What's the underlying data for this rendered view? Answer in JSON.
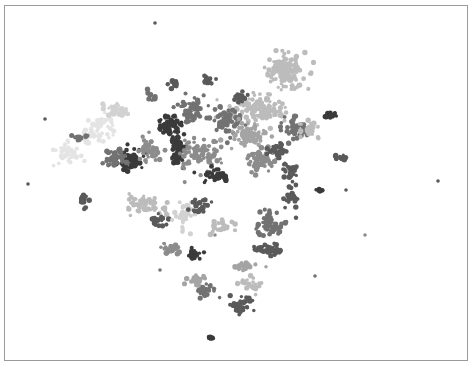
{
  "chart_data": {
    "type": "scatter",
    "title": "",
    "xlabel": "",
    "ylabel": "",
    "axes_visible": false,
    "grid": false,
    "legend": "none",
    "frame": {
      "x": 4,
      "y": 5,
      "width": 464,
      "height": 356,
      "border_color": "#9a9a9a"
    },
    "palette": [
      "#3a3a3a",
      "#5a5a5a",
      "#727272",
      "#8c8c8c",
      "#a4a4a4",
      "#bcbcbc",
      "#d2d2d2",
      "#e4e4e4"
    ],
    "clusters": [
      {
        "cx": 285,
        "cy": 72,
        "rx": 18,
        "ry": 16,
        "shade": 5,
        "n": 140
      },
      {
        "cx": 258,
        "cy": 110,
        "rx": 22,
        "ry": 12,
        "shade": 5,
        "n": 120
      },
      {
        "cx": 240,
        "cy": 96,
        "rx": 8,
        "ry": 6,
        "shade": 1,
        "n": 25
      },
      {
        "cx": 207,
        "cy": 80,
        "rx": 5,
        "ry": 5,
        "shade": 1,
        "n": 14
      },
      {
        "cx": 172,
        "cy": 84,
        "rx": 5,
        "ry": 4,
        "shade": 1,
        "n": 12
      },
      {
        "cx": 151,
        "cy": 97,
        "rx": 6,
        "ry": 5,
        "shade": 2,
        "n": 14
      },
      {
        "cx": 190,
        "cy": 110,
        "rx": 14,
        "ry": 10,
        "shade": 2,
        "n": 60
      },
      {
        "cx": 225,
        "cy": 122,
        "rx": 16,
        "ry": 12,
        "shade": 2,
        "n": 70
      },
      {
        "cx": 167,
        "cy": 125,
        "rx": 12,
        "ry": 8,
        "shade": 0,
        "n": 50
      },
      {
        "cx": 177,
        "cy": 150,
        "rx": 6,
        "ry": 18,
        "shade": 0,
        "n": 70
      },
      {
        "cx": 130,
        "cy": 160,
        "rx": 14,
        "ry": 10,
        "shade": 0,
        "n": 60
      },
      {
        "cx": 115,
        "cy": 158,
        "rx": 10,
        "ry": 8,
        "shade": 2,
        "n": 40
      },
      {
        "cx": 150,
        "cy": 150,
        "rx": 12,
        "ry": 10,
        "shade": 3,
        "n": 45
      },
      {
        "cx": 200,
        "cy": 155,
        "rx": 18,
        "ry": 14,
        "shade": 3,
        "n": 80
      },
      {
        "cx": 215,
        "cy": 175,
        "rx": 12,
        "ry": 6,
        "shade": 0,
        "n": 35
      },
      {
        "cx": 250,
        "cy": 135,
        "rx": 16,
        "ry": 10,
        "shade": 4,
        "n": 70
      },
      {
        "cx": 260,
        "cy": 160,
        "rx": 14,
        "ry": 10,
        "shade": 3,
        "n": 60
      },
      {
        "cx": 280,
        "cy": 150,
        "rx": 10,
        "ry": 8,
        "shade": 1,
        "n": 35
      },
      {
        "cx": 295,
        "cy": 130,
        "rx": 10,
        "ry": 10,
        "shade": 2,
        "n": 40
      },
      {
        "cx": 310,
        "cy": 130,
        "rx": 8,
        "ry": 8,
        "shade": 5,
        "n": 30
      },
      {
        "cx": 290,
        "cy": 170,
        "rx": 8,
        "ry": 8,
        "shade": 1,
        "n": 25
      },
      {
        "cx": 330,
        "cy": 115,
        "rx": 6,
        "ry": 3,
        "shade": 0,
        "n": 14
      },
      {
        "cx": 340,
        "cy": 158,
        "rx": 7,
        "ry": 3,
        "shade": 1,
        "n": 14
      },
      {
        "cx": 100,
        "cy": 130,
        "rx": 16,
        "ry": 12,
        "shade": 7,
        "n": 50
      },
      {
        "cx": 65,
        "cy": 150,
        "rx": 14,
        "ry": 10,
        "shade": 7,
        "n": 35
      },
      {
        "cx": 80,
        "cy": 138,
        "rx": 5,
        "ry": 4,
        "shade": 2,
        "n": 10
      },
      {
        "cx": 115,
        "cy": 110,
        "rx": 10,
        "ry": 8,
        "shade": 6,
        "n": 30
      },
      {
        "cx": 84,
        "cy": 200,
        "rx": 3,
        "ry": 8,
        "shade": 1,
        "n": 18
      },
      {
        "cx": 145,
        "cy": 205,
        "rx": 18,
        "ry": 10,
        "shade": 5,
        "n": 60
      },
      {
        "cx": 160,
        "cy": 220,
        "rx": 8,
        "ry": 6,
        "shade": 1,
        "n": 22
      },
      {
        "cx": 185,
        "cy": 215,
        "rx": 10,
        "ry": 12,
        "shade": 6,
        "n": 40
      },
      {
        "cx": 200,
        "cy": 205,
        "rx": 8,
        "ry": 8,
        "shade": 1,
        "n": 25
      },
      {
        "cx": 222,
        "cy": 225,
        "rx": 10,
        "ry": 8,
        "shade": 5,
        "n": 30
      },
      {
        "cx": 170,
        "cy": 248,
        "rx": 10,
        "ry": 6,
        "shade": 3,
        "n": 28
      },
      {
        "cx": 195,
        "cy": 255,
        "rx": 6,
        "ry": 6,
        "shade": 0,
        "n": 20
      },
      {
        "cx": 206,
        "cy": 290,
        "rx": 10,
        "ry": 8,
        "shade": 2,
        "n": 35
      },
      {
        "cx": 195,
        "cy": 280,
        "rx": 10,
        "ry": 6,
        "shade": 4,
        "n": 25
      },
      {
        "cx": 270,
        "cy": 225,
        "rx": 12,
        "ry": 10,
        "shade": 2,
        "n": 55
      },
      {
        "cx": 268,
        "cy": 250,
        "rx": 12,
        "ry": 6,
        "shade": 1,
        "n": 35
      },
      {
        "cx": 245,
        "cy": 265,
        "rx": 10,
        "ry": 4,
        "shade": 4,
        "n": 25
      },
      {
        "cx": 250,
        "cy": 285,
        "rx": 10,
        "ry": 6,
        "shade": 5,
        "n": 25
      },
      {
        "cx": 240,
        "cy": 305,
        "rx": 10,
        "ry": 10,
        "shade": 1,
        "n": 45
      },
      {
        "cx": 292,
        "cy": 196,
        "rx": 6,
        "ry": 12,
        "shade": 1,
        "n": 25
      },
      {
        "cx": 320,
        "cy": 190,
        "rx": 4,
        "ry": 3,
        "shade": 0,
        "n": 10
      },
      {
        "cx": 211,
        "cy": 338,
        "rx": 4,
        "ry": 2,
        "shade": 0,
        "n": 8
      }
    ],
    "outliers": [
      {
        "x": 155,
        "y": 23,
        "shade": 1
      },
      {
        "x": 45,
        "y": 119,
        "shade": 1
      },
      {
        "x": 28,
        "y": 184,
        "shade": 1
      },
      {
        "x": 438,
        "y": 181,
        "shade": 1
      },
      {
        "x": 365,
        "y": 235,
        "shade": 3
      },
      {
        "x": 315,
        "y": 276,
        "shade": 2
      },
      {
        "x": 346,
        "y": 190,
        "shade": 1
      },
      {
        "x": 160,
        "y": 270,
        "shade": 2
      },
      {
        "x": 215,
        "y": 235,
        "shade": 3
      }
    ]
  }
}
